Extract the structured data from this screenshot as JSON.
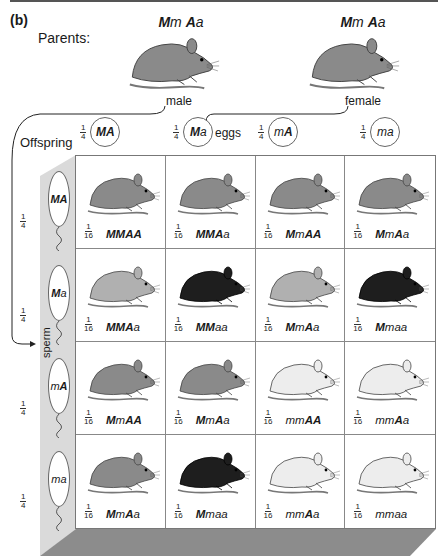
{
  "figure": {
    "panel_label": "(b)",
    "parents_label": "Parents:",
    "offspring_label": "Offspring",
    "eggs_label": "eggs",
    "sperm_label": "sperm"
  },
  "parents": [
    {
      "sex": "male",
      "genotype_parts": [
        [
          "M",
          "dom"
        ],
        [
          "m",
          "rec"
        ],
        [
          " ",
          ""
        ],
        [
          "A",
          "dom"
        ],
        [
          "a",
          "rec"
        ]
      ],
      "coat": "agouti"
    },
    {
      "sex": "female",
      "genotype_parts": [
        [
          "M",
          "dom"
        ],
        [
          "m",
          "rec"
        ],
        [
          " ",
          ""
        ],
        [
          "A",
          "dom"
        ],
        [
          "a",
          "rec"
        ]
      ],
      "coat": "agouti"
    }
  ],
  "eggs": [
    {
      "fraction": {
        "num": "1",
        "den": "4"
      },
      "parts": [
        [
          "M",
          "dom"
        ],
        [
          "A",
          "dom"
        ]
      ]
    },
    {
      "fraction": {
        "num": "1",
        "den": "4"
      },
      "parts": [
        [
          "M",
          "dom"
        ],
        [
          "a",
          "rec"
        ]
      ]
    },
    {
      "fraction": {
        "num": "1",
        "den": "4"
      },
      "parts": [
        [
          "m",
          "rec"
        ],
        [
          "A",
          "dom"
        ]
      ]
    },
    {
      "fraction": {
        "num": "1",
        "den": "4"
      },
      "parts": [
        [
          "m",
          "rec"
        ],
        [
          "a",
          "rec"
        ]
      ]
    }
  ],
  "sperm": [
    {
      "fraction": {
        "num": "1",
        "den": "4"
      },
      "parts": [
        [
          "M",
          "dom"
        ],
        [
          "A",
          "dom"
        ]
      ]
    },
    {
      "fraction": {
        "num": "1",
        "den": "4"
      },
      "parts": [
        [
          "M",
          "dom"
        ],
        [
          "a",
          "rec"
        ]
      ]
    },
    {
      "fraction": {
        "num": "1",
        "den": "4"
      },
      "parts": [
        [
          "m",
          "rec"
        ],
        [
          "A",
          "dom"
        ]
      ]
    },
    {
      "fraction": {
        "num": "1",
        "den": "4"
      },
      "parts": [
        [
          "m",
          "rec"
        ],
        [
          "a",
          "rec"
        ]
      ]
    }
  ],
  "offspring": [
    [
      {
        "fraction": "1/16",
        "parts": [
          [
            "MM",
            "dom"
          ],
          [
            "AA",
            "dom"
          ]
        ],
        "coat": "agouti"
      },
      {
        "fraction": "1/16",
        "parts": [
          [
            "MM",
            "dom"
          ],
          [
            "A",
            "dom"
          ],
          [
            "a",
            "rec"
          ]
        ],
        "coat": "agouti"
      },
      {
        "fraction": "1/16",
        "parts": [
          [
            "M",
            "dom"
          ],
          [
            "m",
            "rec"
          ],
          [
            "AA",
            "dom"
          ]
        ],
        "coat": "agouti"
      },
      {
        "fraction": "1/16",
        "parts": [
          [
            "M",
            "dom"
          ],
          [
            "m",
            "rec"
          ],
          [
            "A",
            "dom"
          ],
          [
            "a",
            "rec"
          ]
        ],
        "coat": "agouti"
      }
    ],
    [
      {
        "fraction": "1/16",
        "parts": [
          [
            "MM",
            "dom"
          ],
          [
            "A",
            "dom"
          ],
          [
            "a",
            "rec"
          ]
        ],
        "coat": "agouti-light"
      },
      {
        "fraction": "1/16",
        "parts": [
          [
            "MM",
            "dom"
          ],
          [
            "aa",
            "rec"
          ]
        ],
        "coat": "black"
      },
      {
        "fraction": "1/16",
        "parts": [
          [
            "M",
            "dom"
          ],
          [
            "m",
            "rec"
          ],
          [
            "A",
            "dom"
          ],
          [
            "a",
            "rec"
          ]
        ],
        "coat": "agouti-light"
      },
      {
        "fraction": "1/16",
        "parts": [
          [
            "M",
            "dom"
          ],
          [
            "maa",
            "rec"
          ]
        ],
        "coat": "black"
      }
    ],
    [
      {
        "fraction": "1/16",
        "parts": [
          [
            "M",
            "dom"
          ],
          [
            "m",
            "rec"
          ],
          [
            "AA",
            "dom"
          ]
        ],
        "coat": "agouti"
      },
      {
        "fraction": "1/16",
        "parts": [
          [
            "M",
            "dom"
          ],
          [
            "m",
            "rec"
          ],
          [
            "A",
            "dom"
          ],
          [
            "a",
            "rec"
          ]
        ],
        "coat": "agouti"
      },
      {
        "fraction": "1/16",
        "parts": [
          [
            "mm",
            "rec"
          ],
          [
            "AA",
            "dom"
          ]
        ],
        "coat": "white"
      },
      {
        "fraction": "1/16",
        "parts": [
          [
            "mm",
            "rec"
          ],
          [
            "A",
            "dom"
          ],
          [
            "a",
            "rec"
          ]
        ],
        "coat": "white"
      }
    ],
    [
      {
        "fraction": "1/16",
        "parts": [
          [
            "M",
            "dom"
          ],
          [
            "m",
            "rec"
          ],
          [
            "A",
            "dom"
          ],
          [
            "a",
            "rec"
          ]
        ],
        "coat": "agouti"
      },
      {
        "fraction": "1/16",
        "parts": [
          [
            "M",
            "dom"
          ],
          [
            "maa",
            "rec"
          ]
        ],
        "coat": "black"
      },
      {
        "fraction": "1/16",
        "parts": [
          [
            "mm",
            "rec"
          ],
          [
            "A",
            "dom"
          ],
          [
            "a",
            "rec"
          ]
        ],
        "coat": "white"
      },
      {
        "fraction": "1/16",
        "parts": [
          [
            "mmaa",
            "rec"
          ]
        ],
        "coat": "white"
      }
    ]
  ],
  "colors": {
    "agouti": "#8a8a8a",
    "agouti-light": "#b0b0b0",
    "black": "#1e1e1e",
    "white": "#ededed",
    "strip": "#d9d9d9",
    "floor": "#8c8c8c"
  }
}
